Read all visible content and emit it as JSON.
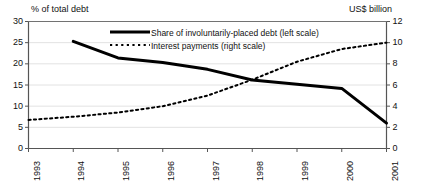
{
  "chart_data": {
    "type": "line",
    "title": "",
    "subtitle": "",
    "xlabel": "",
    "ylabel": "% of total debt",
    "y2label": "US$ billion",
    "x": [
      "1993",
      "1994",
      "1995",
      "1996",
      "1997",
      "1998",
      "1999",
      "2000",
      "2001"
    ],
    "xlim": [
      1993,
      2001
    ],
    "ylim": [
      0,
      30
    ],
    "y2lim": [
      0,
      12
    ],
    "yticks": [
      0,
      5,
      10,
      15,
      20,
      25,
      30
    ],
    "y2ticks": [
      0,
      2,
      4,
      6,
      8,
      10,
      12
    ],
    "grid": true,
    "legend_position": "upper-center",
    "series": [
      {
        "name": "Share of involuntarily-placed debt (left scale)",
        "axis": "left",
        "style": "solid",
        "linewidth": 3,
        "color": "#000000",
        "x": [
          "1994",
          "1995",
          "1996",
          "1997",
          "1998",
          "1999",
          "2000",
          "2001"
        ],
        "values": [
          25.3,
          21.4,
          20.3,
          18.7,
          16.2,
          15.2,
          14.2,
          6.0
        ]
      },
      {
        "name": "Interest payments (right scale)",
        "axis": "right",
        "style": "dotted",
        "linewidth": 2,
        "color": "#000000",
        "x": [
          "1993",
          "1994",
          "1995",
          "1996",
          "1997",
          "1998",
          "1999",
          "2000",
          "2001"
        ],
        "values": [
          2.7,
          3.0,
          3.4,
          4.0,
          5.0,
          6.5,
          8.2,
          9.4,
          10.0
        ]
      }
    ]
  },
  "axes": {
    "left_title": "% of total debt",
    "right_title": "US$ billion",
    "left_ticks": [
      "30",
      "25",
      "20",
      "15",
      "10",
      "5",
      "0"
    ],
    "right_ticks": [
      "12",
      "10",
      "8",
      "6",
      "4",
      "2",
      "0"
    ],
    "x_ticks": [
      "1993",
      "1994",
      "1995",
      "1996",
      "1997",
      "1998",
      "1999",
      "2000",
      "2001"
    ]
  },
  "legend": {
    "solid_label": "Share of involuntarily-placed debt (left scale)",
    "dotted_label": "Interest payments (right scale)"
  },
  "colors": {
    "line": "#000000",
    "frame": "#555555",
    "grid": "#e2e2e2",
    "background": "#ffffff"
  }
}
